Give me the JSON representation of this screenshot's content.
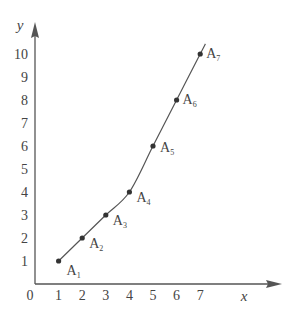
{
  "chart_data": {
    "type": "line",
    "title": "",
    "xlabel": "x",
    "ylabel": "y",
    "origin_label": "0",
    "x_ticks": [
      "1",
      "2",
      "3",
      "4",
      "5",
      "6",
      "7"
    ],
    "y_ticks": [
      "1",
      "2",
      "3",
      "4",
      "5",
      "6",
      "7",
      "8",
      "9",
      "10"
    ],
    "xlim": [
      0,
      8.5
    ],
    "ylim": [
      0,
      11
    ],
    "grid": false,
    "legend": null,
    "series": [
      {
        "name": "curve",
        "points": [
          {
            "label": "A",
            "sub": "1",
            "x": 1,
            "y": 1
          },
          {
            "label": "A",
            "sub": "2",
            "x": 2,
            "y": 2
          },
          {
            "label": "A",
            "sub": "3",
            "x": 3,
            "y": 3
          },
          {
            "label": "A",
            "sub": "4",
            "x": 4,
            "y": 4
          },
          {
            "label": "A",
            "sub": "5",
            "x": 5,
            "y": 6
          },
          {
            "label": "A",
            "sub": "6",
            "x": 6,
            "y": 8
          },
          {
            "label": "A",
            "sub": "7",
            "x": 7,
            "y": 10
          }
        ]
      }
    ],
    "colors": {
      "axis": "#555555",
      "curve": "#555555",
      "text": "#444444"
    }
  }
}
